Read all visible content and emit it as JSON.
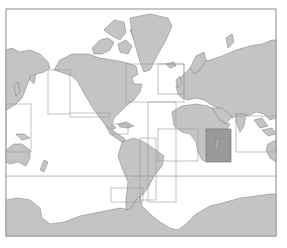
{
  "map": {
    "type": "world-chart-index",
    "projection": "mercator",
    "colors": {
      "background": "#ffffff",
      "land": "#c4c4c4",
      "coast": "#7a7a7a",
      "chart_boundary": "#9a9a9a",
      "highlighted_area": "#9a9a9a",
      "frame": "#8a8a8a"
    },
    "highlighted_region": "Madagascar / western Indian Ocean"
  }
}
